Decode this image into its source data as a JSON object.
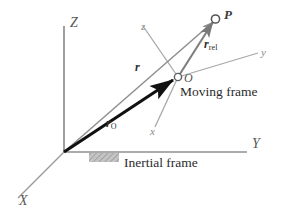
{
  "figure": {
    "background_color": "#ffffff"
  },
  "inertial_frame": {
    "label": "Inertial frame",
    "origin_label": "",
    "axes": [
      {
        "name": "Z",
        "label": "Z",
        "direction": "up"
      },
      {
        "name": "Y",
        "label": "Y",
        "direction": "right"
      },
      {
        "name": "X",
        "label": "X",
        "direction": "lower-left"
      }
    ],
    "axis_color": "#8c8c8c",
    "ground_support": "hatched-block"
  },
  "moving_frame": {
    "label": "Moving frame",
    "origin_label": "O",
    "axes": [
      {
        "name": "z",
        "label": "z",
        "direction": "upper-left"
      },
      {
        "name": "y",
        "label": "y",
        "direction": "upper-right"
      },
      {
        "name": "x",
        "label": "x",
        "direction": "lower-left"
      }
    ],
    "axis_color": "#a0a0a0"
  },
  "points": [
    {
      "name": "P",
      "label": "P",
      "marker": "open-circle"
    },
    {
      "name": "O",
      "label": "O",
      "marker": "open-circle"
    }
  ],
  "vectors": [
    {
      "name": "r",
      "label": "r",
      "subscript": "",
      "from": "inertial-origin",
      "to": "P",
      "style": "thin-gray",
      "color": "#8f8f8f"
    },
    {
      "name": "r_O",
      "label": "r",
      "subscript": "O",
      "from": "inertial-origin",
      "to": "O",
      "style": "thick-black",
      "color": "#111111"
    },
    {
      "name": "r_rel",
      "label": "r",
      "subscript": "rel",
      "from": "O",
      "to": "P",
      "style": "medium-gray",
      "color": "#7a7a7a"
    }
  ],
  "colors": {
    "line_gray": "#8c8c8c",
    "line_light": "#a8a8a8",
    "vector_black": "#111111",
    "text": "#2b2b2b",
    "ground_fill": "#b9b9b9"
  }
}
